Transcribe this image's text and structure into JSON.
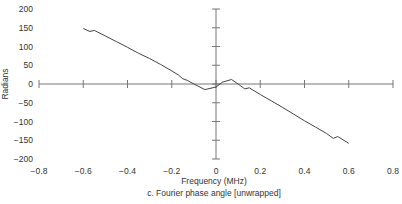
{
  "chart_data": {
    "type": "line",
    "title": "",
    "caption": "c. Fourier phase angle [unwrapped]",
    "xlabel": "Frequency (MHz)",
    "ylabel": "Radians",
    "xlim": [
      -0.8,
      0.8
    ],
    "ylim": [
      -200,
      200
    ],
    "xticks": [
      "-0.8",
      "-0.6",
      "-0.4",
      "-0.2",
      "0",
      "0.2",
      "0.4",
      "0.6",
      "0.8"
    ],
    "yticks": [
      "200",
      "150",
      "100",
      "50",
      "0",
      "-50",
      "-100",
      "-150",
      "-200"
    ],
    "xtick_values": [
      -0.8,
      -0.6,
      -0.4,
      -0.2,
      0,
      0.2,
      0.4,
      0.6,
      0.8
    ],
    "ytick_values": [
      200,
      150,
      100,
      50,
      0,
      -50,
      -100,
      -150,
      -200
    ],
    "grid": false,
    "line_color": "#444444",
    "series": [
      {
        "name": "phase",
        "x": [
          -0.6,
          -0.57,
          -0.55,
          -0.5,
          -0.45,
          -0.4,
          -0.35,
          -0.3,
          -0.25,
          -0.2,
          -0.17,
          -0.15,
          -0.13,
          -0.1,
          -0.05,
          0,
          0.03,
          0.07,
          0.1,
          0.13,
          0.15,
          0.2,
          0.25,
          0.3,
          0.35,
          0.4,
          0.45,
          0.5,
          0.53,
          0.55,
          0.6
        ],
        "y": [
          148,
          140,
          143,
          128,
          113,
          98,
          82,
          68,
          52,
          35,
          24,
          14,
          10,
          0,
          -15,
          -8,
          5,
          12,
          0,
          -13,
          -10,
          -28,
          -45,
          -62,
          -80,
          -98,
          -115,
          -132,
          -145,
          -140,
          -158
        ]
      }
    ]
  }
}
